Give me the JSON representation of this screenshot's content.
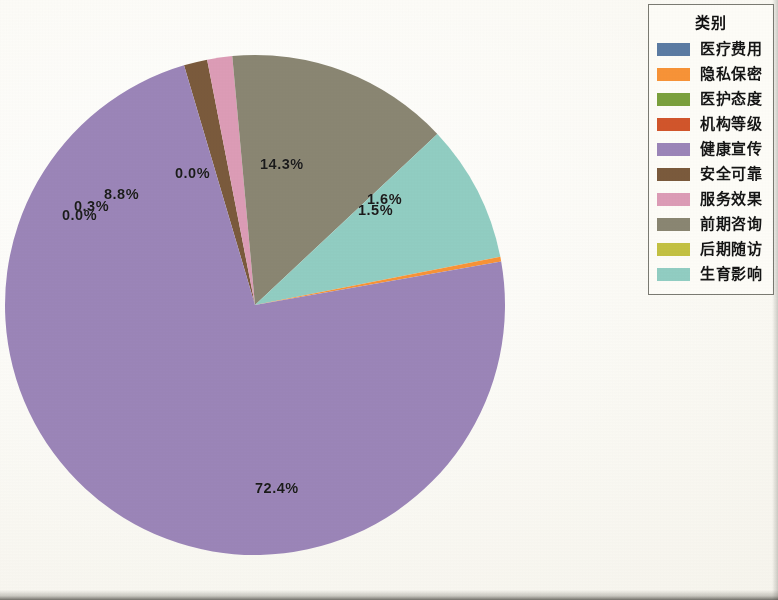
{
  "chart_data": {
    "type": "pie",
    "title": "",
    "legend_title": "类别",
    "legend_position": "right",
    "categories": [
      "医疗费用",
      "隐私保密",
      "医护态度",
      "机构等级",
      "健康宣传",
      "安全可靠",
      "服务效果",
      "前期咨询",
      "后期随访",
      "生育影响"
    ],
    "values": [
      0.0,
      0.3,
      0.0,
      0.0,
      72.4,
      1.5,
      1.6,
      14.3,
      0.0,
      8.8
    ],
    "labels": [
      "0.0%",
      "0.3%",
      "0.0%",
      "0.0%",
      "72.4%",
      "1.5%",
      "1.6%",
      "14.3%",
      "0.0%",
      "8.8%"
    ],
    "colors": [
      "#5b7ba3",
      "#f79337",
      "#7aa03c",
      "#d1552b",
      "#9b85b8",
      "#7a5a3c",
      "#dc9cb6",
      "#8a8672",
      "#c3c142",
      "#91cdc2"
    ],
    "unit": "%"
  },
  "pie": {
    "visible_labels": [
      {
        "text": "8.8%",
        "left": 104,
        "top": 186
      },
      {
        "text": "0.0%",
        "left": 175,
        "top": 165
      },
      {
        "text": "14.3%",
        "left": 260,
        "top": 156
      },
      {
        "text": "0.3%",
        "left": 74,
        "top": 198
      },
      {
        "text": "0.0%",
        "left": 62,
        "top": 207
      },
      {
        "text": "1.6%",
        "left": 367,
        "top": 191
      },
      {
        "text": "1.5%",
        "left": 358,
        "top": 202
      },
      {
        "text": "72.4%",
        "left": 255,
        "top": 480
      }
    ]
  },
  "legend": {
    "title": "类别",
    "items": [
      {
        "label": "医疗费用",
        "color": "#5b7ba3"
      },
      {
        "label": "隐私保密",
        "color": "#f79337"
      },
      {
        "label": "医护态度",
        "color": "#7aa03c"
      },
      {
        "label": "机构等级",
        "color": "#d1552b"
      },
      {
        "label": "健康宣传",
        "color": "#9b85b8"
      },
      {
        "label": "安全可靠",
        "color": "#7a5a3c"
      },
      {
        "label": "服务效果",
        "color": "#dc9cb6"
      },
      {
        "label": "前期咨询",
        "color": "#8a8672"
      },
      {
        "label": "后期随访",
        "color": "#c3c142"
      },
      {
        "label": "生育影响",
        "color": "#91cdc2"
      }
    ]
  }
}
